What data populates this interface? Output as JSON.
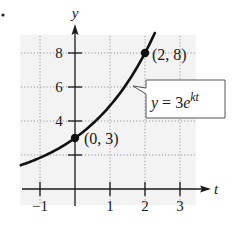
{
  "chart_data": {
    "type": "line",
    "title": "",
    "xlabel": "t",
    "ylabel": "y",
    "xlim": [
      -1.55,
      3.8
    ],
    "ylim": [
      0,
      9.6
    ],
    "x_ticks": [
      -1,
      1,
      2,
      3
    ],
    "x_tick_labels": [
      "−1",
      "1",
      "2",
      "3"
    ],
    "y_ticks": [
      2,
      4,
      6,
      8
    ],
    "y_tick_labels": [
      "",
      "4",
      "6",
      "8"
    ],
    "grid": true,
    "grid_style": "dotted",
    "series": [
      {
        "name": "y = 3e^(kt)",
        "function": "3*exp(k*t)",
        "k": 0.4904,
        "t_range": [
          -1.55,
          2.28
        ],
        "color": "#111111"
      }
    ],
    "points": [
      {
        "t": 0,
        "y": 3,
        "label": "(0, 3)"
      },
      {
        "t": 2,
        "y": 8,
        "label": "(2, 8)"
      }
    ],
    "annotation": {
      "text_prefix": "y = 3e",
      "superscript": "kt",
      "points_to_t": 1.65
    }
  },
  "labels": {
    "y_axis": "y",
    "t_axis": "t",
    "point_a": "(0, 3)",
    "point_b": "(2, 8)",
    "callout_y": "y",
    "callout_eq": " = 3",
    "callout_e": "e",
    "callout_sup": "kt"
  },
  "colors": {
    "grid_background": "#f3f3f3",
    "grid_line": "#9a9a9a",
    "axis": "#1a1a1a",
    "curve": "#111111"
  }
}
